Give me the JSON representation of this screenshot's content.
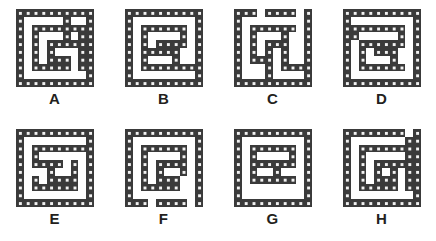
{
  "sheet": {
    "background_color": "#ffffff",
    "wall_color": "#3a3a3a",
    "wall_dot_color": "#f2f2f2",
    "label_color": "#231f20",
    "columns": 4,
    "rows": 2,
    "total_mazes": 8
  },
  "mazes": [
    {
      "id": "maze-a",
      "label": "A",
      "cell_size": 8,
      "grid_cols": 10,
      "grid_rows": 10,
      "walls": [
        [
          0,
          0,
          10,
          1
        ],
        [
          0,
          0,
          1,
          10
        ],
        [
          0,
          9,
          10,
          1
        ],
        [
          9,
          0,
          1,
          10
        ],
        [
          2,
          2,
          7,
          1
        ],
        [
          2,
          2,
          1,
          6
        ],
        [
          2,
          7,
          5,
          1
        ],
        [
          4,
          4,
          4,
          1
        ],
        [
          4,
          4,
          1,
          3
        ],
        [
          4,
          6,
          3,
          1
        ],
        [
          6,
          1,
          1,
          4
        ],
        [
          8,
          3,
          1,
          5
        ],
        [
          6,
          6,
          1,
          2
        ]
      ]
    },
    {
      "id": "maze-b",
      "label": "B",
      "cell_size": 8,
      "grid_cols": 10,
      "grid_rows": 10,
      "walls": [
        [
          0,
          0,
          10,
          1
        ],
        [
          0,
          0,
          1,
          10
        ],
        [
          0,
          9,
          10,
          1
        ],
        [
          9,
          0,
          1,
          10
        ],
        [
          2,
          2,
          6,
          1
        ],
        [
          2,
          2,
          1,
          6
        ],
        [
          2,
          7,
          7,
          1
        ],
        [
          4,
          4,
          4,
          1
        ],
        [
          4,
          4,
          1,
          2
        ],
        [
          4,
          5,
          3,
          1
        ],
        [
          6,
          4,
          1,
          3
        ],
        [
          7,
          2,
          1,
          3
        ],
        [
          2,
          5,
          2,
          1
        ]
      ]
    },
    {
      "id": "maze-c",
      "label": "C",
      "cell_size": 8,
      "grid_cols": 10,
      "grid_rows": 10,
      "walls": [
        [
          0,
          0,
          3,
          1
        ],
        [
          4,
          0,
          4,
          1
        ],
        [
          0,
          0,
          1,
          10
        ],
        [
          0,
          9,
          10,
          1
        ],
        [
          9,
          0,
          1,
          10
        ],
        [
          2,
          2,
          6,
          1
        ],
        [
          2,
          2,
          1,
          5
        ],
        [
          2,
          6,
          3,
          1
        ],
        [
          4,
          4,
          3,
          1
        ],
        [
          4,
          4,
          1,
          4
        ],
        [
          6,
          2,
          1,
          5
        ],
        [
          6,
          7,
          3,
          1
        ],
        [
          4,
          7,
          1,
          2
        ]
      ]
    },
    {
      "id": "maze-d",
      "label": "D",
      "cell_size": 8,
      "grid_cols": 10,
      "grid_rows": 10,
      "walls": [
        [
          0,
          0,
          10,
          1
        ],
        [
          0,
          0,
          1,
          10
        ],
        [
          0,
          9,
          10,
          1
        ],
        [
          9,
          0,
          1,
          10
        ],
        [
          1,
          2,
          7,
          1
        ],
        [
          1,
          2,
          1,
          2
        ],
        [
          2,
          4,
          6,
          1
        ],
        [
          2,
          4,
          1,
          4
        ],
        [
          2,
          7,
          6,
          1
        ],
        [
          4,
          5,
          3,
          1
        ],
        [
          6,
          5,
          1,
          3
        ],
        [
          7,
          2,
          1,
          3
        ]
      ]
    },
    {
      "id": "maze-e",
      "label": "E",
      "cell_size": 8,
      "grid_cols": 10,
      "grid_rows": 10,
      "walls": [
        [
          0,
          0,
          10,
          1
        ],
        [
          0,
          0,
          1,
          10
        ],
        [
          0,
          9,
          10,
          1
        ],
        [
          9,
          0,
          1,
          10
        ],
        [
          2,
          2,
          7,
          1
        ],
        [
          2,
          2,
          1,
          3
        ],
        [
          2,
          4,
          4,
          1
        ],
        [
          4,
          4,
          1,
          3
        ],
        [
          4,
          6,
          4,
          1
        ],
        [
          2,
          6,
          1,
          2
        ],
        [
          2,
          7,
          5,
          1
        ],
        [
          7,
          4,
          1,
          4
        ]
      ]
    },
    {
      "id": "maze-f",
      "label": "F",
      "cell_size": 8,
      "grid_cols": 10,
      "grid_rows": 10,
      "walls": [
        [
          0,
          0,
          10,
          1
        ],
        [
          0,
          0,
          1,
          10
        ],
        [
          0,
          9,
          3,
          1
        ],
        [
          4,
          9,
          4,
          1
        ],
        [
          9,
          0,
          1,
          10
        ],
        [
          2,
          2,
          6,
          1
        ],
        [
          2,
          2,
          1,
          6
        ],
        [
          2,
          7,
          4,
          1
        ],
        [
          4,
          4,
          4,
          1
        ],
        [
          4,
          4,
          1,
          3
        ],
        [
          4,
          6,
          3,
          1
        ],
        [
          6,
          6,
          1,
          2
        ],
        [
          7,
          2,
          1,
          4
        ]
      ]
    },
    {
      "id": "maze-g",
      "label": "G",
      "cell_size": 8,
      "grid_cols": 10,
      "grid_rows": 10,
      "walls": [
        [
          0,
          0,
          10,
          1
        ],
        [
          0,
          0,
          1,
          10
        ],
        [
          0,
          9,
          10,
          1
        ],
        [
          9,
          0,
          1,
          10
        ],
        [
          2,
          2,
          6,
          1
        ],
        [
          2,
          2,
          1,
          5
        ],
        [
          2,
          6,
          6,
          1
        ],
        [
          4,
          4,
          4,
          1
        ],
        [
          4,
          4,
          1,
          1
        ],
        [
          5,
          4,
          1,
          2
        ],
        [
          7,
          2,
          1,
          3
        ],
        [
          2,
          4,
          2,
          1
        ]
      ]
    },
    {
      "id": "maze-h",
      "label": "H",
      "cell_size": 8,
      "grid_cols": 10,
      "grid_rows": 10,
      "walls": [
        [
          0,
          0,
          8,
          1
        ],
        [
          0,
          0,
          1,
          10
        ],
        [
          0,
          9,
          10,
          1
        ],
        [
          9,
          0,
          1,
          10
        ],
        [
          2,
          2,
          6,
          1
        ],
        [
          2,
          2,
          1,
          6
        ],
        [
          2,
          7,
          5,
          1
        ],
        [
          4,
          4,
          4,
          1
        ],
        [
          4,
          4,
          1,
          3
        ],
        [
          4,
          6,
          3,
          1
        ],
        [
          6,
          4,
          1,
          3
        ],
        [
          8,
          1,
          1,
          7
        ]
      ]
    }
  ]
}
